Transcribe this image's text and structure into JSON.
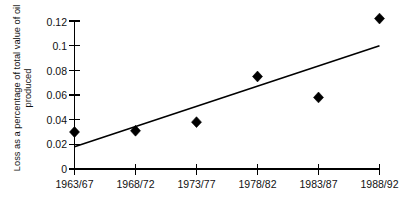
{
  "chart_data": {
    "type": "scatter",
    "title": "",
    "xlabel": "",
    "ylabel": "Loss as a percentage of total value of oil produced",
    "ylabel_line1": "Loss as a percentage of total value of oil",
    "ylabel_line2": "produced",
    "categories": [
      "1963/67",
      "1968/72",
      "1973/77",
      "1978/82",
      "1983/87",
      "1988/92"
    ],
    "values": [
      0.03,
      0.031,
      0.038,
      0.075,
      0.058,
      0.122
    ],
    "ylim": [
      0,
      0.12
    ],
    "ytick_labels": [
      "0",
      "0.02",
      "0.04",
      "0.06",
      "0.08",
      "0.1",
      "0.12"
    ],
    "ytick_values": [
      0,
      0.02,
      0.04,
      0.06,
      0.08,
      0.1,
      0.12
    ],
    "grid": false,
    "legend": false,
    "legend_position": "none",
    "marker_style": "filled-diamond",
    "series": [
      {
        "name": "Loss as a percentage of total value of oil produced",
        "values": [
          0.03,
          0.031,
          0.038,
          0.075,
          0.058,
          0.122
        ]
      },
      {
        "name": "linear trend",
        "type": "line",
        "x_endpoints": [
          "1963/67",
          "1988/92"
        ],
        "y_endpoints": [
          0.018,
          0.1
        ]
      }
    ],
    "colors": {
      "marker": "#000000",
      "trend_line": "#000000",
      "axis": "#000000",
      "background": "#ffffff"
    }
  }
}
